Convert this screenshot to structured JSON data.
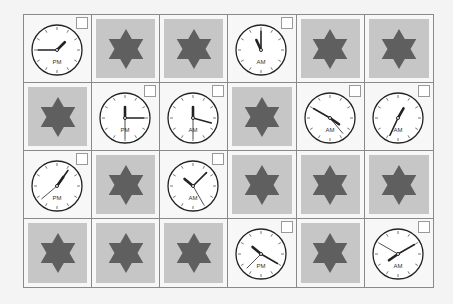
{
  "puzzle": {
    "rows": 4,
    "cols": 6,
    "colors": {
      "tile": "#c6c6c6",
      "star": "#5f5f5f",
      "grid_line": "#8a8a8a",
      "clock_face": "#ffffff",
      "clock_hand": "#222222"
    },
    "cells": [
      {
        "type": "clock",
        "period": "PM",
        "hour_deg": 45,
        "minute_deg": 270,
        "second_deg": null
      },
      {
        "type": "star"
      },
      {
        "type": "star"
      },
      {
        "type": "clock",
        "period": "AM",
        "hour_deg": 335,
        "minute_deg": 0,
        "second_deg": null
      },
      {
        "type": "star"
      },
      {
        "type": "star"
      },
      {
        "type": "star"
      },
      {
        "type": "clock",
        "period": "PM",
        "hour_deg": 0,
        "minute_deg": 90,
        "second_deg": 180
      },
      {
        "type": "clock",
        "period": "AM",
        "hour_deg": 0,
        "minute_deg": 105,
        "second_deg": 180
      },
      {
        "type": "star"
      },
      {
        "type": "clock",
        "period": "AM",
        "hour_deg": 125,
        "minute_deg": 300,
        "second_deg": 140
      },
      {
        "type": "clock",
        "period": "AM",
        "hour_deg": 30,
        "minute_deg": 205,
        "second_deg": null
      },
      {
        "type": "clock",
        "period": "PM",
        "hour_deg": 35,
        "minute_deg": 35,
        "second_deg": 230
      },
      {
        "type": "star"
      },
      {
        "type": "clock",
        "period": "AM",
        "hour_deg": 310,
        "minute_deg": 45,
        "second_deg": 150
      },
      {
        "type": "star"
      },
      {
        "type": "star"
      },
      {
        "type": "star"
      },
      {
        "type": "star"
      },
      {
        "type": "star"
      },
      {
        "type": "star"
      },
      {
        "type": "clock",
        "period": "PM",
        "hour_deg": 310,
        "minute_deg": 120,
        "second_deg": 225
      },
      {
        "type": "star"
      },
      {
        "type": "clock",
        "period": "AM",
        "hour_deg": 235,
        "minute_deg": 60,
        "second_deg": 300
      }
    ]
  }
}
